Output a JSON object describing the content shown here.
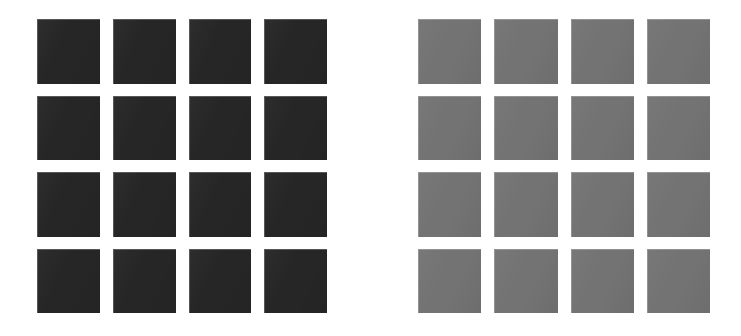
{
  "canvas": {
    "width": 741,
    "height": 336,
    "background_color": "#ffffff"
  },
  "figure": {
    "type": "swatch-grid-pair",
    "panel_count": 2,
    "panels": [
      {
        "id": "left-panel",
        "name": "dark-swatch-grid",
        "fill_color": "#262626",
        "rows": 4,
        "columns": 4,
        "cell_count": 16,
        "bounds": {
          "x": 37,
          "y": 19,
          "width": 290,
          "height": 294
        },
        "cell_size": {
          "width": 63,
          "height": 63
        },
        "gap": {
          "column": 13,
          "row": 12
        },
        "cells": [
          {
            "row": 1,
            "column": 1,
            "color": "#262626"
          },
          {
            "row": 1,
            "column": 2,
            "color": "#262626"
          },
          {
            "row": 1,
            "column": 3,
            "color": "#262626"
          },
          {
            "row": 1,
            "column": 4,
            "color": "#262626"
          },
          {
            "row": 2,
            "column": 1,
            "color": "#262626"
          },
          {
            "row": 2,
            "column": 2,
            "color": "#262626"
          },
          {
            "row": 2,
            "column": 3,
            "color": "#262626"
          },
          {
            "row": 2,
            "column": 4,
            "color": "#262626"
          },
          {
            "row": 3,
            "column": 1,
            "color": "#262626"
          },
          {
            "row": 3,
            "column": 2,
            "color": "#262626"
          },
          {
            "row": 3,
            "column": 3,
            "color": "#262626"
          },
          {
            "row": 3,
            "column": 4,
            "color": "#262626"
          },
          {
            "row": 4,
            "column": 1,
            "color": "#262626"
          },
          {
            "row": 4,
            "column": 2,
            "color": "#262626"
          },
          {
            "row": 4,
            "column": 3,
            "color": "#262626"
          },
          {
            "row": 4,
            "column": 4,
            "color": "#262626"
          }
        ]
      },
      {
        "id": "right-panel",
        "name": "gray-swatch-grid",
        "fill_color": "#737373",
        "rows": 4,
        "columns": 4,
        "cell_count": 16,
        "bounds": {
          "x": 418,
          "y": 19,
          "width": 292,
          "height": 294
        },
        "cell_size": {
          "width": 63,
          "height": 63
        },
        "gap": {
          "column": 13,
          "row": 12
        },
        "cells": [
          {
            "row": 1,
            "column": 1,
            "color": "#737373"
          },
          {
            "row": 1,
            "column": 2,
            "color": "#737373"
          },
          {
            "row": 1,
            "column": 3,
            "color": "#737373"
          },
          {
            "row": 1,
            "column": 4,
            "color": "#737373"
          },
          {
            "row": 2,
            "column": 1,
            "color": "#737373"
          },
          {
            "row": 2,
            "column": 2,
            "color": "#737373"
          },
          {
            "row": 2,
            "column": 3,
            "color": "#737373"
          },
          {
            "row": 2,
            "column": 4,
            "color": "#737373"
          },
          {
            "row": 3,
            "column": 1,
            "color": "#737373"
          },
          {
            "row": 3,
            "column": 2,
            "color": "#737373"
          },
          {
            "row": 3,
            "column": 3,
            "color": "#737373"
          },
          {
            "row": 3,
            "column": 4,
            "color": "#737373"
          },
          {
            "row": 4,
            "column": 1,
            "color": "#737373"
          },
          {
            "row": 4,
            "column": 2,
            "color": "#737373"
          },
          {
            "row": 4,
            "column": 3,
            "color": "#737373"
          },
          {
            "row": 4,
            "column": 4,
            "color": "#737373"
          }
        ]
      }
    ]
  }
}
